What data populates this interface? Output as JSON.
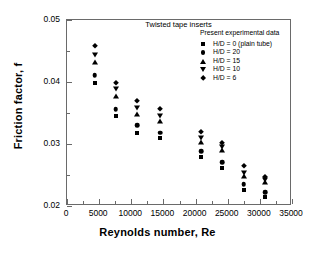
{
  "chart_data": {
    "type": "scatter",
    "title": "Twisted tape inserts",
    "xlabel": "Reynolds number, Re",
    "ylabel": "Friction factor, f",
    "xlim": [
      0,
      35000
    ],
    "ylim": [
      0.02,
      0.05
    ],
    "xticks": [
      0,
      5000,
      10000,
      15000,
      20000,
      25000,
      30000,
      35000
    ],
    "xtick_labels": [
      "0",
      "5000",
      "10000",
      "15000",
      "20000",
      "25000",
      "30000",
      "35000"
    ],
    "yticks": [
      0.02,
      0.03,
      0.04,
      0.05
    ],
    "ytick_labels": [
      "0.02",
      "0.03",
      "0.04",
      "0.05"
    ],
    "y_minor_ticks": [
      0.025,
      0.035,
      0.045
    ],
    "x_minor_ticks": [
      2500,
      7500,
      12500,
      17500,
      22500,
      27500,
      32500
    ],
    "grid": false,
    "legend_position": "top-right",
    "legend_title": "Present experimental data",
    "series": [
      {
        "name": "H/D = 0 (plain tube)",
        "marker": "square",
        "x": [
          4300,
          7600,
          10900,
          14500,
          20900,
          24100,
          27500,
          30800
        ],
        "y": [
          0.0399,
          0.0345,
          0.0318,
          0.0309,
          0.0279,
          0.0262,
          0.0226,
          0.0215
        ]
      },
      {
        "name": "H/D = 20",
        "marker": "circle",
        "x": [
          4300,
          7600,
          10900,
          14500,
          20900,
          24100,
          27500,
          30800
        ],
        "y": [
          0.0411,
          0.0356,
          0.033,
          0.0318,
          0.0288,
          0.0271,
          0.0235,
          0.0222
        ]
      },
      {
        "name": "H/D = 15",
        "marker": "triangle-up",
        "x": [
          4300,
          7600,
          10900,
          14500,
          20900,
          24100,
          27500,
          30800
        ],
        "y": [
          0.0432,
          0.0377,
          0.0349,
          0.0337,
          0.0304,
          0.029,
          0.0249,
          0.0238
        ]
      },
      {
        "name": "H/D = 10",
        "marker": "triangle-down",
        "x": [
          4300,
          7600,
          10900,
          14500,
          20900,
          24100,
          27500,
          30800
        ],
        "y": [
          0.0444,
          0.0388,
          0.0358,
          0.0345,
          0.031,
          0.0295,
          0.0254,
          0.0242
        ]
      },
      {
        "name": "H/D = 6",
        "marker": "diamond",
        "x": [
          4300,
          7600,
          10900,
          14500,
          20900,
          24100,
          27500,
          30800
        ],
        "y": [
          0.0458,
          0.0398,
          0.0369,
          0.0356,
          0.032,
          0.0302,
          0.0264,
          0.0247
        ]
      }
    ]
  }
}
